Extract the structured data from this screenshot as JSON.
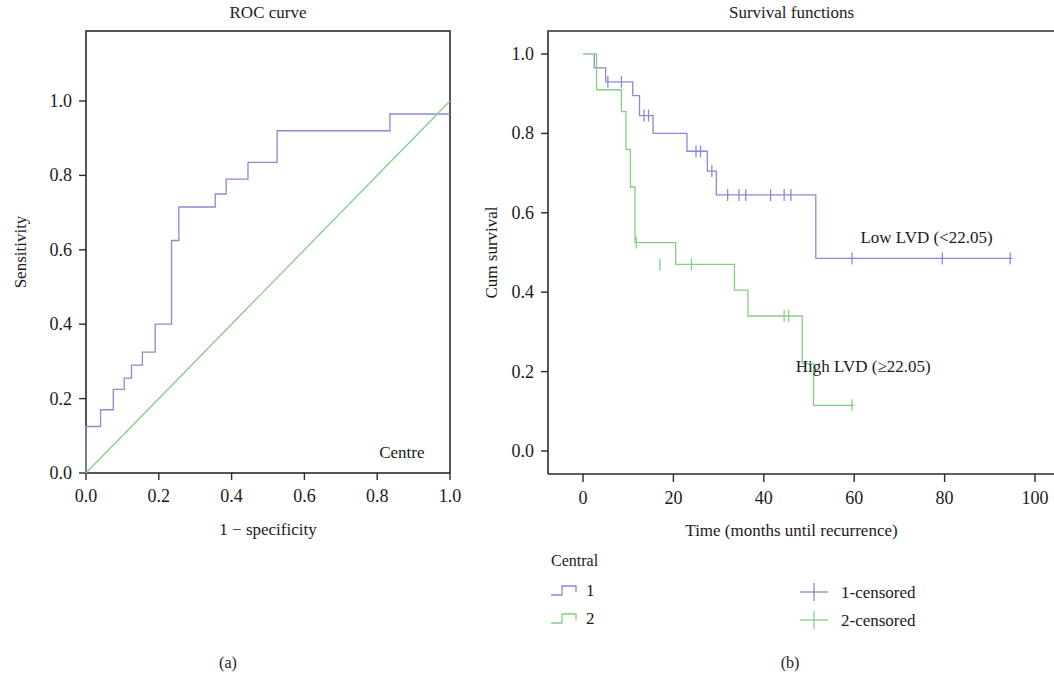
{
  "figure": {
    "subcaption_a": "(a)",
    "subcaption_b": "(b)"
  },
  "colors": {
    "series1_blue": "#8a8ad6",
    "series2_green": "#86ce86",
    "axis": "#2b2b2b",
    "text": "#1a1a1a",
    "background": "#ffffff"
  },
  "panel_a": {
    "title": "ROC curve",
    "xlabel": "1 − specificity",
    "ylabel": "Sensitivity",
    "annotation": "Centre",
    "xticks": [
      "0.0",
      "0.2",
      "0.4",
      "0.6",
      "0.8",
      "1.0"
    ],
    "yticks": [
      "0.0",
      "0.2",
      "0.4",
      "0.6",
      "0.8",
      "1.0"
    ]
  },
  "panel_b": {
    "title": "Survival functions",
    "xlabel": "Time (months until recurrence)",
    "ylabel": "Cum survival",
    "annotation_low": "Low LVD (<22.05)",
    "annotation_high": "High LVD (≥22.05)",
    "xticks": [
      "0",
      "20",
      "40",
      "60",
      "80",
      "100"
    ],
    "yticks": [
      "0.0",
      "0.2",
      "0.4",
      "0.6",
      "0.8",
      "1.0"
    ]
  },
  "legend": {
    "title": "Central",
    "items": [
      {
        "label": "1",
        "color": "#8a8ad6",
        "marker": "step"
      },
      {
        "label": "2",
        "color": "#86ce86",
        "marker": "step"
      },
      {
        "label": "1-censored",
        "color": "#8a8ad6",
        "marker": "plus"
      },
      {
        "label": "2-censored",
        "color": "#86ce86",
        "marker": "plus"
      }
    ]
  },
  "chart_data": [
    {
      "type": "line",
      "id": "roc",
      "title": "ROC curve",
      "xlabel": "1 − specificity",
      "ylabel": "Sensitivity",
      "xlim": [
        0.0,
        1.0
      ],
      "ylim": [
        0.0,
        1.0
      ],
      "xticks": [
        0.0,
        0.2,
        0.4,
        0.6,
        0.8,
        1.0
      ],
      "yticks": [
        0.0,
        0.2,
        0.4,
        0.6,
        0.8,
        1.0
      ],
      "grid": false,
      "legend_position": "none",
      "annotations": [
        {
          "text": "Centre",
          "x": 0.93,
          "y": 0.04
        }
      ],
      "series": [
        {
          "name": "ROC",
          "color": "#8a8ad6",
          "step": true,
          "points": [
            [
              0.0,
              0.0
            ],
            [
              0.0,
              0.125
            ],
            [
              0.04,
              0.125
            ],
            [
              0.04,
              0.17
            ],
            [
              0.075,
              0.17
            ],
            [
              0.075,
              0.225
            ],
            [
              0.105,
              0.225
            ],
            [
              0.105,
              0.255
            ],
            [
              0.125,
              0.255
            ],
            [
              0.125,
              0.29
            ],
            [
              0.155,
              0.29
            ],
            [
              0.155,
              0.325
            ],
            [
              0.19,
              0.325
            ],
            [
              0.19,
              0.4
            ],
            [
              0.235,
              0.4
            ],
            [
              0.235,
              0.625
            ],
            [
              0.255,
              0.625
            ],
            [
              0.255,
              0.715
            ],
            [
              0.355,
              0.715
            ],
            [
              0.355,
              0.75
            ],
            [
              0.385,
              0.75
            ],
            [
              0.385,
              0.79
            ],
            [
              0.445,
              0.79
            ],
            [
              0.445,
              0.835
            ],
            [
              0.525,
              0.835
            ],
            [
              0.525,
              0.92
            ],
            [
              0.835,
              0.92
            ],
            [
              0.835,
              0.965
            ],
            [
              1.0,
              0.965
            ]
          ]
        },
        {
          "name": "Reference diagonal",
          "color": "#86ce86",
          "step": false,
          "points": [
            [
              0.0,
              0.0
            ],
            [
              1.0,
              1.0
            ]
          ]
        }
      ]
    },
    {
      "type": "line",
      "id": "kaplan-meier",
      "title": "Survival functions",
      "xlabel": "Time (months until recurrence)",
      "ylabel": "Cum survival",
      "xlim": [
        -4,
        104
      ],
      "ylim": [
        -0.07,
        1.07
      ],
      "xticks": [
        0,
        20,
        40,
        60,
        80,
        100
      ],
      "yticks": [
        0.0,
        0.2,
        0.4,
        0.6,
        0.8,
        1.0
      ],
      "grid": false,
      "legend_position": "below",
      "annotations": [
        {
          "text": "Low LVD (<22.05)",
          "x": 76,
          "y": 0.525
        },
        {
          "text": "High LVD (≥22.05)",
          "x": 62,
          "y": 0.2
        }
      ],
      "series": [
        {
          "name": "1 (Low LVD)",
          "color": "#8a8ad6",
          "step": true,
          "points": [
            [
              2.5,
              1.0
            ],
            [
              2.5,
              0.965
            ],
            [
              5.0,
              0.965
            ],
            [
              5.0,
              0.93
            ],
            [
              11.0,
              0.93
            ],
            [
              11.0,
              0.895
            ],
            [
              12.5,
              0.895
            ],
            [
              12.5,
              0.845
            ],
            [
              15.5,
              0.845
            ],
            [
              15.5,
              0.8
            ],
            [
              23.0,
              0.8
            ],
            [
              23.0,
              0.755
            ],
            [
              27.5,
              0.755
            ],
            [
              27.5,
              0.705
            ],
            [
              29.5,
              0.705
            ],
            [
              29.5,
              0.645
            ],
            [
              51.5,
              0.645
            ],
            [
              51.5,
              0.485
            ],
            [
              95.0,
              0.485
            ]
          ],
          "censored": [
            [
              5.5,
              0.93
            ],
            [
              8.5,
              0.93
            ],
            [
              13.5,
              0.845
            ],
            [
              14.5,
              0.845
            ],
            [
              25.0,
              0.755
            ],
            [
              26.0,
              0.755
            ],
            [
              28.5,
              0.705
            ],
            [
              32.0,
              0.645
            ],
            [
              34.5,
              0.645
            ],
            [
              36.0,
              0.645
            ],
            [
              41.5,
              0.645
            ],
            [
              44.5,
              0.645
            ],
            [
              46.0,
              0.645
            ],
            [
              59.5,
              0.485
            ],
            [
              79.5,
              0.485
            ],
            [
              94.5,
              0.485
            ]
          ]
        },
        {
          "name": "2 (High LVD)",
          "color": "#86ce86",
          "step": true,
          "points": [
            [
              0.0,
              1.0
            ],
            [
              0.0,
              1.0
            ],
            [
              3.0,
              1.0
            ],
            [
              3.0,
              0.91
            ],
            [
              8.5,
              0.91
            ],
            [
              8.5,
              0.855
            ],
            [
              9.5,
              0.855
            ],
            [
              9.5,
              0.76
            ],
            [
              10.5,
              0.76
            ],
            [
              10.5,
              0.665
            ],
            [
              11.5,
              0.665
            ],
            [
              11.5,
              0.525
            ],
            [
              20.5,
              0.525
            ],
            [
              20.5,
              0.47
            ],
            [
              33.5,
              0.47
            ],
            [
              33.5,
              0.405
            ],
            [
              36.5,
              0.405
            ],
            [
              36.5,
              0.34
            ],
            [
              48.5,
              0.34
            ],
            [
              48.5,
              0.22
            ],
            [
              51.0,
              0.22
            ],
            [
              51.0,
              0.115
            ],
            [
              60.0,
              0.115
            ]
          ],
          "censored": [
            [
              11.8,
              0.525
            ],
            [
              17.0,
              0.47
            ],
            [
              24.0,
              0.47
            ],
            [
              44.5,
              0.34
            ],
            [
              45.5,
              0.34
            ],
            [
              59.5,
              0.115
            ]
          ]
        }
      ]
    }
  ]
}
